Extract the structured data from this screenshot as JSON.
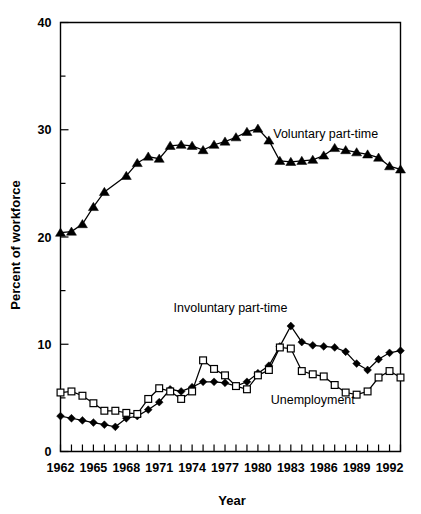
{
  "chart_data": {
    "type": "line",
    "title": "",
    "xlabel": "Year",
    "ylabel": "Percent of workforce",
    "xlim": [
      1962,
      1993
    ],
    "ylim": [
      0,
      40
    ],
    "y_major_ticks": [
      0,
      10,
      20,
      30,
      40
    ],
    "y_minor_ticks": [
      5,
      15,
      25,
      35
    ],
    "y_ticklabels": [
      "0",
      "10",
      "20",
      "30",
      "40"
    ],
    "x_ticks": [
      1962,
      1963,
      1964,
      1965,
      1966,
      1967,
      1968,
      1969,
      1970,
      1971,
      1972,
      1973,
      1974,
      1975,
      1976,
      1977,
      1978,
      1979,
      1980,
      1981,
      1982,
      1983,
      1984,
      1985,
      1986,
      1987,
      1988,
      1989,
      1990,
      1991,
      1992,
      1993
    ],
    "x_ticklabels": [
      "1962",
      "1965",
      "1968",
      "1971",
      "1974",
      "1977",
      "1980",
      "1983",
      "1986",
      "1989",
      "1992"
    ],
    "x_labeled_years": [
      1962,
      1965,
      1968,
      1971,
      1974,
      1977,
      1980,
      1983,
      1986,
      1989,
      1992
    ],
    "grid": false,
    "legend_position": "inline-annotations",
    "series": [
      {
        "name": "Voluntary part-time",
        "marker": "triangle",
        "label_x": 1981.4,
        "label_y": 29.2,
        "x": [
          1962,
          1963,
          1964,
          1965,
          1966,
          1968,
          1969,
          1970,
          1971,
          1972,
          1973,
          1974,
          1975,
          1976,
          1977,
          1978,
          1979,
          1980,
          1981,
          1982,
          1983,
          1984,
          1985,
          1986,
          1987,
          1988,
          1989,
          1990,
          1991,
          1992,
          1993
        ],
        "values": [
          20.4,
          20.5,
          21.2,
          22.8,
          24.2,
          25.7,
          26.9,
          27.5,
          27.3,
          28.5,
          28.6,
          28.5,
          28.1,
          28.6,
          28.9,
          29.3,
          29.8,
          30.1,
          29.0,
          27.1,
          27.0,
          27.1,
          27.2,
          27.6,
          28.3,
          28.1,
          27.9,
          27.7,
          27.4,
          26.6,
          26.3
        ]
      },
      {
        "name": "Involuntary part-time",
        "marker": "diamond",
        "label_x": 1977.5,
        "label_y": 13.0,
        "x": [
          1962,
          1963,
          1964,
          1965,
          1966,
          1967,
          1968,
          1969,
          1970,
          1971,
          1972,
          1973,
          1974,
          1975,
          1976,
          1977,
          1978,
          1979,
          1980,
          1981,
          1982,
          1983,
          1984,
          1985,
          1986,
          1987,
          1988,
          1989,
          1990,
          1991,
          1992,
          1993
        ],
        "values": [
          3.3,
          3.1,
          2.9,
          2.7,
          2.5,
          2.3,
          3.1,
          3.3,
          3.9,
          4.6,
          5.8,
          5.6,
          6.0,
          6.5,
          6.5,
          6.4,
          6.1,
          6.5,
          7.3,
          8.0,
          9.8,
          11.7,
          10.2,
          9.9,
          9.8,
          9.7,
          9.3,
          8.2,
          7.6,
          8.6,
          9.2,
          9.4
        ]
      },
      {
        "name": "Unemployment",
        "marker": "square",
        "label_x": 1985.0,
        "label_y": 4.4,
        "x": [
          1962,
          1963,
          1964,
          1965,
          1966,
          1967,
          1968,
          1969,
          1970,
          1971,
          1972,
          1973,
          1974,
          1975,
          1976,
          1977,
          1978,
          1979,
          1980,
          1981,
          1982,
          1983,
          1984,
          1985,
          1986,
          1987,
          1988,
          1989,
          1990,
          1991,
          1992,
          1993
        ],
        "values": [
          5.5,
          5.6,
          5.2,
          4.5,
          3.8,
          3.8,
          3.6,
          3.5,
          4.9,
          5.9,
          5.6,
          4.9,
          5.6,
          8.5,
          7.7,
          7.1,
          6.1,
          5.8,
          7.1,
          7.6,
          9.7,
          9.6,
          7.5,
          7.2,
          7.0,
          6.2,
          5.5,
          5.3,
          5.6,
          6.9,
          7.5,
          6.9
        ]
      }
    ]
  },
  "colors": {
    "axis": "#000000",
    "series_voluntary": "#000000",
    "series_involuntary": "#000000",
    "series_unemployment": "#000000",
    "background": "#ffffff"
  }
}
